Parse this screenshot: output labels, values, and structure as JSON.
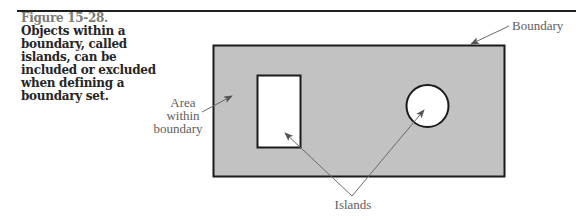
{
  "figure": {
    "number": "Figure 15-28.",
    "caption": "Objects within a boundary, called islands, can be included or excluded when defining a boundary set."
  },
  "diagram": {
    "labels": {
      "boundary": "Boundary",
      "area_line1": "Area",
      "area_line2": "within",
      "area_line3": "boundary",
      "islands": "Islands"
    },
    "colors": {
      "fill": "#c2c2c2",
      "stroke": "#1a1a1a",
      "island_fill": "#ffffff",
      "leader": "#6a6a6a",
      "label": "#5e5e5e"
    }
  }
}
